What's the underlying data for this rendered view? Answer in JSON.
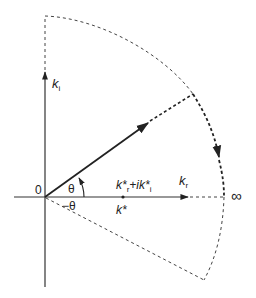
{
  "diagram": {
    "type": "complex-plane contour",
    "colors": {
      "ink": "#222222",
      "background": "#ffffff"
    },
    "labels": {
      "vertical_axis": "k",
      "vertical_axis_sub": "i",
      "horizontal_axis": "k",
      "horizontal_axis_sub": "r",
      "origin": "0",
      "angle_upper": "θ",
      "angle_lower": "−θ",
      "point_above_main": "k*",
      "point_above_sub_r": "r",
      "point_above_plus": "+ik*",
      "point_above_sub_i": "i",
      "point_below": "k*",
      "infinity": "∞"
    }
  }
}
